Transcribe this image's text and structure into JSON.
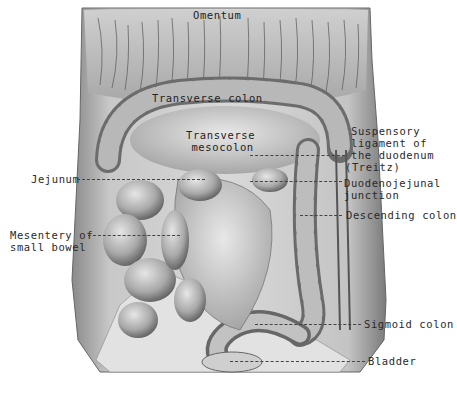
{
  "figure": {
    "colors": {
      "background": "#ffffff",
      "tissue_light": "#d9d9d9",
      "tissue_mid": "#9a9a9a",
      "tissue_dark": "#4a4a4a",
      "label_text": "#2a2a2a"
    }
  },
  "labels": {
    "omentum": "Omentum",
    "transverse_colon": "Transverse colon",
    "transverse_mesocolon_1": "Transverse",
    "transverse_mesocolon_2": "mesocolon",
    "suspensory_1": "Suspensory",
    "suspensory_2": "ligament of",
    "suspensory_3": "the duodenum",
    "suspensory_4": "(Treitz)",
    "duodenojejunal_1": "Duodenojejunal",
    "duodenojejunal_2": "junction",
    "descending_colon": "Descending colon",
    "jejunum": "Jejunum",
    "mesentery_1": "Mesentery of",
    "mesentery_2": "small bowel",
    "sigmoid_colon": "Sigmoid colon",
    "bladder": "Bladder"
  }
}
